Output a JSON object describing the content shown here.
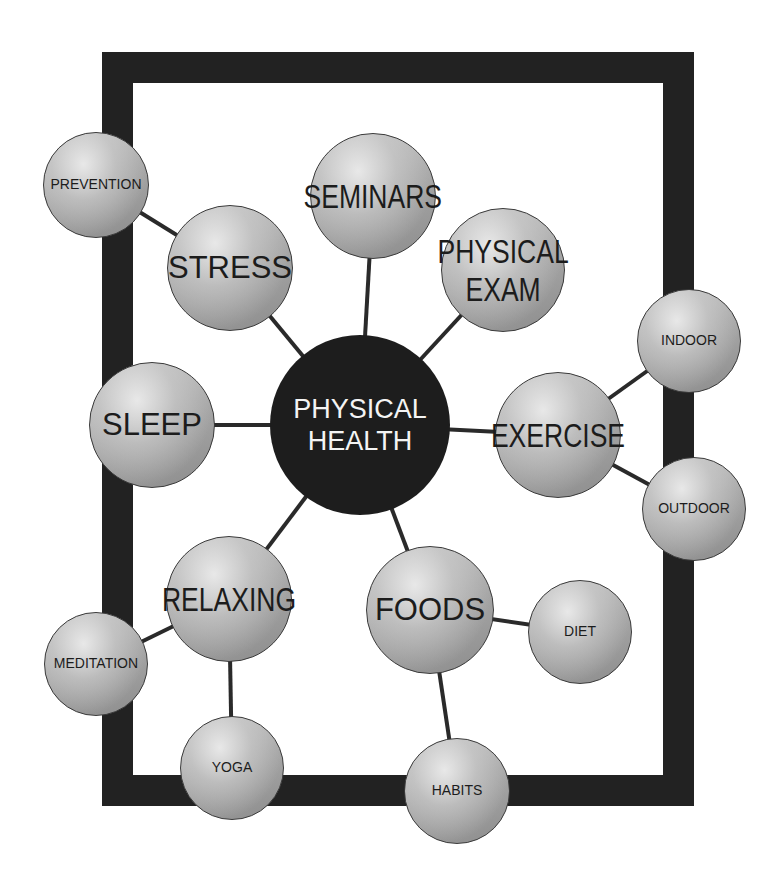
{
  "diagram": {
    "title": "PHYSICAL HEALTH",
    "colors": {
      "frame": "#222222",
      "center_fill": "#1d1d1d",
      "center_text": "#f4f4f4",
      "node_light": "#d2d2d2",
      "node_dark": "#8c8c8c",
      "connector": "#2a2a2a",
      "node_text": "#1c1c1c"
    },
    "frame": {
      "x": 102,
      "y": 52,
      "w": 592,
      "h": 754,
      "thickness": 31
    },
    "center": {
      "id": "physical-health",
      "label": "PHYSICAL\nHEALTH",
      "cx": 360,
      "cy": 425,
      "r": 90
    },
    "nodes": [
      {
        "id": "stress",
        "label": "STRESS",
        "cx": 230,
        "cy": 268,
        "r": 63,
        "size": "big",
        "style": "normal",
        "parent": "physical-health"
      },
      {
        "id": "seminars",
        "label": "SEMINARS",
        "cx": 373,
        "cy": 196,
        "r": 63,
        "size": "big",
        "style": "condensed",
        "parent": "physical-health"
      },
      {
        "id": "physical-exam",
        "label": "PHYSICAL\nEXAM",
        "cx": 503,
        "cy": 270,
        "r": 62,
        "size": "big",
        "style": "condensed",
        "parent": "physical-health"
      },
      {
        "id": "exercise",
        "label": "EXERCISE",
        "cx": 558,
        "cy": 435,
        "r": 63,
        "size": "big",
        "style": "condensed",
        "parent": "physical-health"
      },
      {
        "id": "sleep",
        "label": "SLEEP",
        "cx": 152,
        "cy": 425,
        "r": 63,
        "size": "big",
        "style": "normal",
        "parent": "physical-health"
      },
      {
        "id": "relaxing",
        "label": "RELAXING",
        "cx": 229,
        "cy": 599,
        "r": 63,
        "size": "big",
        "style": "condensed",
        "parent": "physical-health"
      },
      {
        "id": "foods",
        "label": "FOODS",
        "cx": 430,
        "cy": 610,
        "r": 64,
        "size": "big",
        "style": "normal",
        "parent": "physical-health"
      },
      {
        "id": "prevention",
        "label": "PREVENTION",
        "cx": 96,
        "cy": 185,
        "r": 53,
        "size": "small",
        "style": "normal",
        "parent": "stress"
      },
      {
        "id": "indoor",
        "label": "INDOOR",
        "cx": 689,
        "cy": 341,
        "r": 52,
        "size": "small",
        "style": "normal",
        "parent": "exercise"
      },
      {
        "id": "outdoor",
        "label": "OUTDOOR",
        "cx": 694,
        "cy": 509,
        "r": 52,
        "size": "small",
        "style": "normal",
        "parent": "exercise"
      },
      {
        "id": "meditation",
        "label": "MEDITATION",
        "cx": 96,
        "cy": 664,
        "r": 52,
        "size": "small",
        "style": "normal",
        "parent": "relaxing"
      },
      {
        "id": "yoga",
        "label": "YOGA",
        "cx": 232,
        "cy": 768,
        "r": 52,
        "size": "small",
        "style": "normal",
        "parent": "relaxing"
      },
      {
        "id": "diet",
        "label": "DIET",
        "cx": 580,
        "cy": 632,
        "r": 52,
        "size": "small",
        "style": "normal",
        "parent": "foods"
      },
      {
        "id": "habits",
        "label": "HABITS",
        "cx": 457,
        "cy": 791,
        "r": 53,
        "size": "small",
        "style": "normal",
        "parent": "foods"
      }
    ]
  }
}
